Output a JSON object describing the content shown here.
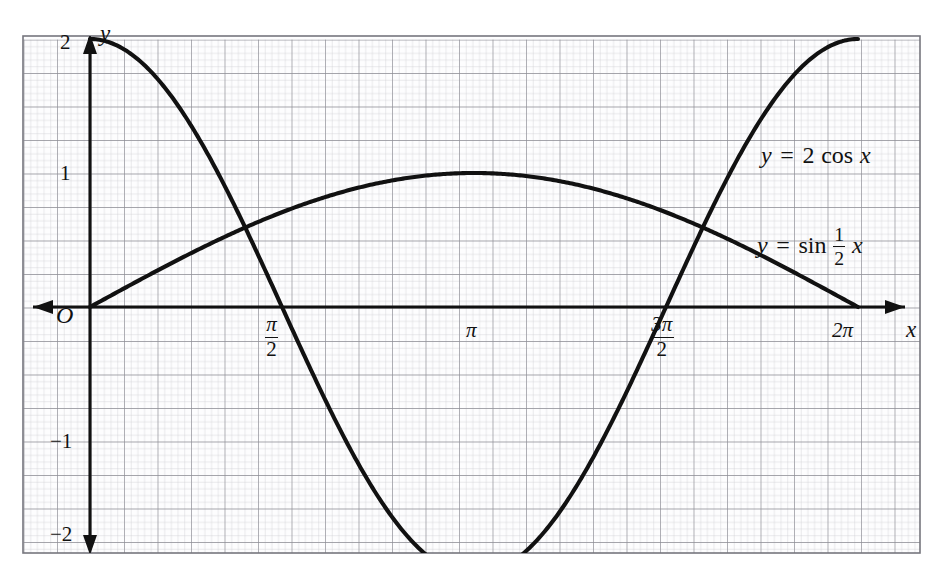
{
  "figure": {
    "kind": "cartesian-graph",
    "background_color": "#ffffff",
    "grid": {
      "minor_color": "#c9c9cf",
      "major_color": "#8d8d95",
      "border_color": "#76767e",
      "minor_step_px": 6.7,
      "major_every": 5,
      "frame": {
        "left": 23,
        "top": 36,
        "right": 920,
        "bottom": 553
      }
    },
    "axes": {
      "curve_color": "#111111",
      "axis_color": "#111111",
      "x_axis_label": "x",
      "y_axis_label": "y",
      "origin_label": "O",
      "x_axis_y_px": 307,
      "y_axis_x_px": 90,
      "unit_y_px": 134,
      "pi_px": 384
    },
    "y_ticks": [
      {
        "label": "2",
        "value": 2
      },
      {
        "label": "1",
        "value": 1
      },
      {
        "label": "−1",
        "value": -1
      },
      {
        "label": "−2",
        "value": -2
      }
    ],
    "x_ticks": [
      {
        "label_num": "π",
        "label_den": "2",
        "stacked": true,
        "value_pi": 0.5
      },
      {
        "label_num": "π",
        "label_den": "",
        "stacked": false,
        "value_pi": 1
      },
      {
        "label_num": "3π",
        "label_den": "2",
        "stacked": true,
        "value_pi": 1.5
      },
      {
        "label_num": "2π",
        "label_den": "",
        "stacked": false,
        "value_pi": 2
      }
    ],
    "curve_labels": {
      "cos": {
        "lhs": "y",
        "eq": "=",
        "coef": "2",
        "fn": "cos",
        "arg": "x"
      },
      "sin": {
        "lhs": "y",
        "eq": "=",
        "fn": "sin",
        "frac_num": "1",
        "frac_den": "2",
        "arg": "x"
      }
    }
  },
  "chart_data": {
    "type": "line",
    "title": "",
    "xlabel": "x",
    "ylabel": "y",
    "grid": true,
    "legend": "inline-curve-labels",
    "xlim": [
      0,
      6.283185307179586
    ],
    "ylim": [
      -2,
      2
    ],
    "xtick_labels": [
      "π/2",
      "π",
      "3π/2",
      "2π"
    ],
    "xtick_values": [
      1.5707963267948966,
      3.141592653589793,
      4.71238898038469,
      6.283185307179586
    ],
    "ytick_labels": [
      "2",
      "1",
      "−1",
      "−2"
    ],
    "ytick_values": [
      2,
      1,
      -1,
      -2
    ],
    "series": [
      {
        "name": "y = 2 cos x",
        "expression": "2*cos(x)",
        "amplitude": 2,
        "period": 6.283185307179586,
        "x": [
          0,
          0.3926990817,
          0.7853981634,
          1.1780972451,
          1.5707963268,
          1.9634954085,
          2.3561944902,
          2.7488935719,
          3.1415926536,
          3.5342917353,
          3.926990817,
          4.3196898987,
          4.7123889804,
          5.1050880621,
          5.4977871438,
          5.8904862255,
          6.2831853072
        ],
        "y": [
          2,
          1.847759065,
          1.4142135624,
          0.7653668647,
          0,
          -0.7653668647,
          -1.4142135624,
          -1.847759065,
          -2,
          -1.847759065,
          -1.4142135624,
          -0.7653668647,
          0,
          0.7653668647,
          1.4142135624,
          1.847759065,
          2
        ],
        "key_points": [
          {
            "x_label": "0",
            "y": 2
          },
          {
            "x_label": "π/2",
            "y": 0
          },
          {
            "x_label": "π",
            "y": -2
          },
          {
            "x_label": "3π/2",
            "y": 0
          },
          {
            "x_label": "2π",
            "y": 2
          }
        ]
      },
      {
        "name": "y = sin 1/2 x",
        "expression": "sin(0.5*x)",
        "amplitude": 1,
        "period": 12.566370614359172,
        "x": [
          0,
          0.3926990817,
          0.7853981634,
          1.1780972451,
          1.5707963268,
          1.9634954085,
          2.3561944902,
          2.7488935719,
          3.1415926536,
          3.5342917353,
          3.926990817,
          4.3196898987,
          4.7123889804,
          5.1050880621,
          5.4977871438,
          5.8904862255,
          6.2831853072
        ],
        "y": [
          0,
          0.195090322,
          0.3826834324,
          0.555570233,
          0.7071067812,
          0.8314696123,
          0.9238795325,
          0.9807852804,
          1,
          0.9807852804,
          0.9238795325,
          0.8314696123,
          0.7071067812,
          0.555570233,
          0.3826834324,
          0.195090322,
          0
        ],
        "key_points": [
          {
            "x_label": "0",
            "y": 0
          },
          {
            "x_label": "π",
            "y": 1
          },
          {
            "x_label": "2π",
            "y": 0
          }
        ]
      }
    ],
    "annotations": [
      {
        "text": "y = 2 cos x",
        "x_px": 762,
        "y_px": 155
      },
      {
        "text": "y = sin 1/2 x",
        "x_px": 757,
        "y_px": 238
      },
      {
        "text": "O",
        "x_px": 63,
        "y_px": 318
      }
    ]
  }
}
